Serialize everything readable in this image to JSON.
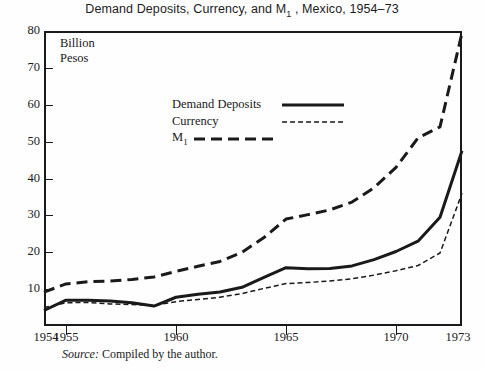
{
  "chart_data": {
    "type": "line",
    "title_main": "Demand Deposits, Currency, and M",
    "title_sub": "1",
    "title_tail": " , Mexico, 1954–73",
    "xlabel": "",
    "ylabel": "Billion Pesos",
    "unit_line1": "Billion",
    "unit_line2": "Pesos",
    "xlim": [
      1954,
      1973
    ],
    "ylim": [
      0,
      80
    ],
    "yticks": [
      80,
      70,
      60,
      50,
      40,
      30,
      20,
      10
    ],
    "xticks": [
      1954,
      1955,
      1960,
      1965,
      1970,
      1973
    ],
    "xtick_labels": [
      "1954",
      "1955",
      "1960",
      "1965",
      "1970",
      "1973"
    ],
    "grid": false,
    "legend_position": "upper-center-left",
    "x": [
      1954,
      1955,
      1956,
      1957,
      1958,
      1959,
      1960,
      1961,
      1962,
      1963,
      1964,
      1965,
      1966,
      1967,
      1968,
      1969,
      1970,
      1971,
      1972,
      1973
    ],
    "series": [
      {
        "name": "Demand Deposits",
        "style": "solid-thick",
        "values": [
          4.2,
          7.0,
          7.0,
          6.8,
          6.3,
          5.4,
          7.8,
          8.6,
          9.2,
          10.5,
          13.2,
          15.8,
          15.5,
          15.6,
          16.3,
          18.0,
          20.2,
          23.0,
          29.5,
          47.5
        ]
      },
      {
        "name": "Currency",
        "style": "dotted-thin",
        "values": [
          5.0,
          6.3,
          6.4,
          6.0,
          5.8,
          5.6,
          6.6,
          7.2,
          7.8,
          8.8,
          10.2,
          11.5,
          11.8,
          12.2,
          12.8,
          13.8,
          15.0,
          16.4,
          19.8,
          36.0
        ]
      },
      {
        "name": "M₁",
        "style": "dashed-thick",
        "values": [
          9.2,
          11.4,
          12.0,
          12.2,
          12.6,
          13.3,
          14.8,
          16.2,
          17.5,
          20.0,
          24.0,
          29.0,
          30.2,
          31.5,
          33.6,
          37.5,
          43.0,
          51.0,
          54.0,
          79.5
        ]
      }
    ]
  },
  "legend": {
    "items": [
      {
        "label": "Demand Deposits",
        "label_sub": "",
        "style": "solid-thick"
      },
      {
        "label": "Currency",
        "label_sub": "",
        "style": "dotted-thin"
      },
      {
        "label": "M",
        "label_sub": "1",
        "style": "dashed-thick"
      }
    ]
  },
  "source": {
    "prefix": "Source:",
    "text": " Compiled by the author."
  },
  "colors": {
    "ink": "#1a1a1a",
    "background": "#fefefe"
  }
}
